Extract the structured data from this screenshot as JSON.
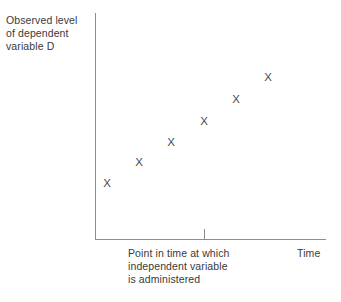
{
  "figure": {
    "y_axis_label": "Observed level\nof dependent\nvariable D",
    "x_axis_event_label": "Point in time at which\nindependent variable\nis administered",
    "x_axis_right_label": "Time",
    "marker_glyph": "X",
    "axis_color": "#8e8e90",
    "text_color": "#3a3a3c",
    "marker_color": "#4a4a4c"
  },
  "chart_data": {
    "type": "scatter",
    "title": "",
    "subtitle": "",
    "xlabel": "Time",
    "ylabel": "Observed level of dependent variable D",
    "xlim": [
      0,
      100
    ],
    "ylim": [
      0,
      100
    ],
    "grid": false,
    "legend": "none",
    "marker": "X",
    "xticklabels": [],
    "yticklabels": [],
    "annotations": [
      {
        "text": "Point in time at which independent variable is administered",
        "x": 47,
        "kind": "x-axis-tick-annotation"
      },
      {
        "text": "Time",
        "x": 100,
        "kind": "x-axis-end-label"
      }
    ],
    "series": [
      {
        "name": "Observed level of dependent variable D",
        "points": [
          {
            "x": 5,
            "y": 24
          },
          {
            "x": 19,
            "y": 33
          },
          {
            "x": 33,
            "y": 42
          },
          {
            "x": 47,
            "y": 51
          },
          {
            "x": 61,
            "y": 61
          },
          {
            "x": 75,
            "y": 71
          }
        ]
      }
    ],
    "points_px": [
      {
        "left": 107,
        "top": 184
      },
      {
        "left": 139,
        "top": 163
      },
      {
        "left": 171,
        "top": 143
      },
      {
        "left": 204,
        "top": 122
      },
      {
        "left": 236,
        "top": 100
      },
      {
        "left": 268,
        "top": 78
      }
    ]
  }
}
